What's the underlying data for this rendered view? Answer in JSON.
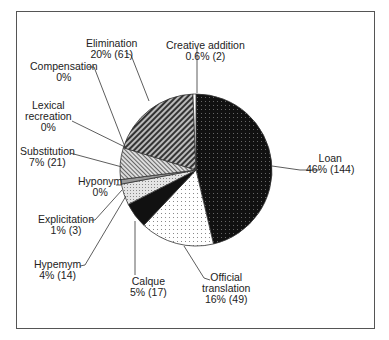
{
  "chart_data": {
    "type": "pie",
    "title": "",
    "total": 310,
    "slices": [
      {
        "name": "Loan",
        "percent": 46,
        "count": 144,
        "pattern": "black-dotted",
        "label_line1": "Loan",
        "label_line2": "46% (144)"
      },
      {
        "name": "Official translation",
        "percent": 16,
        "count": 49,
        "pattern": "white-dotted",
        "label_line1": "Official",
        "label_line2": "translation",
        "label_line3": "16% (49)"
      },
      {
        "name": "Calque",
        "percent": 5,
        "count": 17,
        "pattern": "black-solid",
        "label_line1": "Calque",
        "label_line2": "5% (17)"
      },
      {
        "name": "Hypemym",
        "percent": 4,
        "count": 14,
        "pattern": "light-gray-dotted",
        "label_line1": "Hypemym",
        "label_line2": "4% (14)"
      },
      {
        "name": "Explicitation",
        "percent": 1,
        "count": 3,
        "pattern": "gray",
        "label_line1": "Explicitation",
        "label_line2": "1% (3)"
      },
      {
        "name": "Hyponym",
        "percent": 0,
        "count": 0,
        "pattern": "none",
        "label_line1": "Hyponym",
        "label_line2": "0%"
      },
      {
        "name": "Substitution",
        "percent": 7,
        "count": 21,
        "pattern": "gray-diagonal",
        "label_line1": "Substitution",
        "label_line2": "7% (21)"
      },
      {
        "name": "Lexical recreation",
        "percent": 0,
        "count": 0,
        "pattern": "none",
        "label_line1": "Lexical",
        "label_line2": "recreation",
        "label_line3": "0%"
      },
      {
        "name": "Compensation",
        "percent": 0,
        "count": 0,
        "pattern": "none",
        "label_line1": "Compensation",
        "label_line2": "0%"
      },
      {
        "name": "Elimination",
        "percent": 20,
        "count": 61,
        "pattern": "dark-diagonal",
        "label_line1": "Elimination",
        "label_line2": "20% (61)"
      },
      {
        "name": "Creative addition",
        "percent": 0.6,
        "count": 2,
        "pattern": "white",
        "label_line1": "Creative addition",
        "label_line2": "0.6% (2)"
      }
    ],
    "legend": "none (callout labels)"
  }
}
